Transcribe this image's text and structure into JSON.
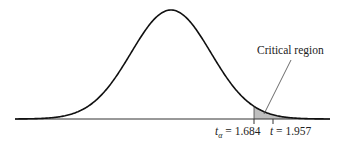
{
  "chart_data": {
    "type": "area",
    "title": "",
    "xlabel": "",
    "ylabel": "",
    "grid": false,
    "legend": "none",
    "critical_value": {
      "symbol": "t",
      "subscript": "α",
      "value": 1.684,
      "label": "t_α = 1.684"
    },
    "test_statistic": {
      "symbol": "t",
      "value": 1.957,
      "label": "t = 1.957"
    },
    "shaded_region": {
      "from": 1.684,
      "to": "inf",
      "label": "Critical region",
      "color": "#bfbfbf"
    },
    "annotations": [
      "Critical region",
      "t_α = 1.684",
      "t = 1.957"
    ]
  },
  "labels": {
    "critical_region": "Critical region",
    "t_alpha_sym": "t",
    "t_alpha_sub": "α",
    "t_alpha_eq": " = 1.684",
    "t_sym": "t",
    "t_eq": " = 1.957"
  },
  "colors": {
    "curve": "#111111",
    "shade": "#bfbfbf",
    "axis": "#333333"
  }
}
